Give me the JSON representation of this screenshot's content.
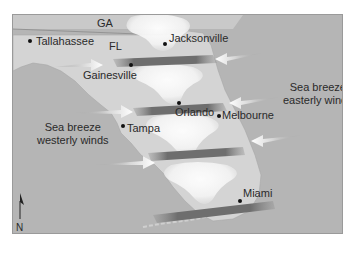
{
  "map": {
    "states": [
      {
        "id": "ga",
        "label": "GA"
      },
      {
        "id": "fl",
        "label": "FL"
      }
    ],
    "cities": [
      {
        "id": "tallahassee",
        "label": "Tallahassee"
      },
      {
        "id": "jacksonville",
        "label": "Jacksonville"
      },
      {
        "id": "gainesville",
        "label": "Gainesville"
      },
      {
        "id": "orlando",
        "label": "Orlando"
      },
      {
        "id": "melbourne",
        "label": "Melbourne"
      },
      {
        "id": "tampa",
        "label": "Tampa"
      },
      {
        "id": "miami",
        "label": "Miami"
      }
    ],
    "annotations": {
      "east_line1": "Sea breeze",
      "east_line2": "easterly winds",
      "west_line1": "Sea breeze",
      "west_line2": "westerly winds"
    },
    "north_arrow": {
      "label": "N",
      "icon": "north-arrow-icon"
    },
    "colors": {
      "ocean": "#b5b5b5",
      "land": "#d4d4d4",
      "cloud": "#ffffff",
      "convergence_band": "#777777",
      "wind_arrow": "#eeeeee",
      "text": "#2a2a2a"
    }
  }
}
